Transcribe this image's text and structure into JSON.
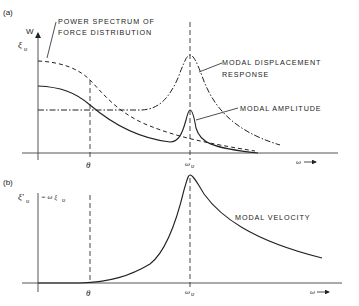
{
  "panel_a": {
    "tag": "(a)",
    "y_axis_label_top": "W",
    "y_axis_label_sym": "ξ",
    "y_axis_label_sub": "υ",
    "x_axis_label": "ω",
    "x_arrow": "→",
    "theta_label": "θ",
    "omega_label": "ω",
    "omega_sub": "υ",
    "annotations": {
      "power_spectrum_line1": "POWER SPECTRUM OF",
      "power_spectrum_line2": "FORCE DISTRIBUTION",
      "displacement_line1": "MODAL DISPLACEMENT",
      "displacement_line2": "RESPONSE",
      "amplitude": "MODAL AMPLITUDE"
    }
  },
  "panel_b": {
    "tag": "(b)",
    "y_axis_label_sym": "ξ'",
    "y_axis_label_sub": "υ",
    "y_axis_eq": "= ω ξ",
    "y_axis_eq_sub": "υ",
    "x_axis_label": "ω",
    "x_arrow": "→",
    "theta_label": "θ",
    "omega_label": "ω",
    "omega_sub": "υ",
    "annotations": {
      "velocity": "MODAL VELOCITY"
    }
  },
  "legend_styles": {
    "power_spectrum": "dashed",
    "modal_displacement_response": "dash-dot",
    "modal_amplitude": "solid",
    "modal_velocity": "solid"
  }
}
